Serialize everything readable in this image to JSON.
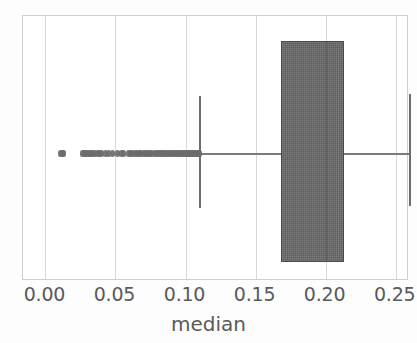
{
  "figure": {
    "width": 417,
    "height": 343,
    "background": "#fdfdfd",
    "frame_color": "#cfcfcf",
    "grid_color": "#d8d8d8",
    "box_fill_color": "#5c5c5c",
    "whisker_color": "#6e6e6e",
    "outlier_color": "#6b6b6b",
    "text_color": "#5a5a5a"
  },
  "axis": {
    "x_label": "median",
    "tick_labels": [
      "0.00",
      "0.05",
      "0.10",
      "0.15",
      "0.20",
      "0.25"
    ],
    "tick_values": [
      0.0,
      0.05,
      0.1,
      0.15,
      0.2,
      0.25
    ],
    "xlim": [
      -0.016,
      0.2595
    ],
    "grid": "vertical-only",
    "y_ticks": []
  },
  "chart_data": {
    "type": "box",
    "title": "",
    "xlabel": "median",
    "ylabel": "",
    "orientation": "horizontal",
    "grid": true,
    "legend": "none",
    "xlim": [
      -0.016,
      0.2595
    ],
    "categories": [
      "median"
    ],
    "series": [
      {
        "name": "median",
        "q1": 0.168,
        "q3": 0.213,
        "median": 0.2005,
        "whisker_low": 0.11,
        "whisker_high": 0.26,
        "box_low": 0.168,
        "box_high": 0.213,
        "outliers": [
          0.011,
          0.0122,
          0.0132,
          0.0265,
          0.0276,
          0.0288,
          0.03,
          0.0312,
          0.0325,
          0.0338,
          0.035,
          0.0372,
          0.0386,
          0.04,
          0.0432,
          0.0447,
          0.048,
          0.0512,
          0.0545,
          0.056,
          0.059,
          0.0604,
          0.0618,
          0.064,
          0.0655,
          0.0668,
          0.0682,
          0.07,
          0.0714,
          0.0728,
          0.0742,
          0.076,
          0.0775,
          0.079,
          0.0805,
          0.0818,
          0.0832,
          0.0846,
          0.086,
          0.0874,
          0.0888,
          0.09,
          0.0912,
          0.0925,
          0.0938,
          0.095,
          0.0962,
          0.0974,
          0.0986,
          0.0998,
          0.1008,
          0.1018,
          0.1028,
          0.1038,
          0.1048,
          0.1058,
          0.1068,
          0.1078,
          0.1088,
          0.1095,
          0.11
        ]
      }
    ]
  }
}
